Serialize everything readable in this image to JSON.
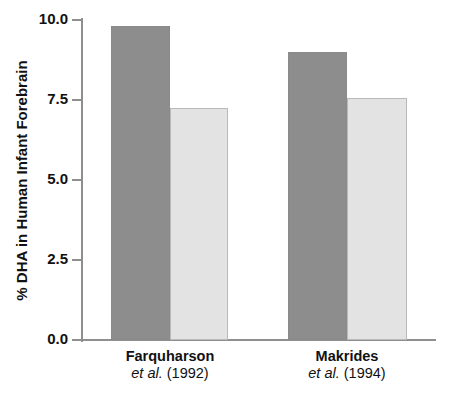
{
  "chart_data": {
    "type": "bar",
    "title": "",
    "xlabel": "",
    "ylabel": "% DHA in Human Infant Forebrain",
    "ylim": [
      0.0,
      10.0
    ],
    "ytick_labels": [
      "0.0",
      "2.5",
      "5.0",
      "7.5",
      "10.0"
    ],
    "ytick_values": [
      0.0,
      2.5,
      5.0,
      7.5,
      10.0
    ],
    "grid": false,
    "legend": "none",
    "categories": [
      "Farquharson et al. (1992)",
      "Makrides et al. (1994)"
    ],
    "category_labels": [
      {
        "name": "Farquharson",
        "cite_italic": "et al.",
        "cite_year": "(1992)"
      },
      {
        "name": "Makrides",
        "cite_italic": "et al.",
        "cite_year": "(1994)"
      }
    ],
    "series": [
      {
        "name": "dark-bar",
        "color": "#8d8d8d",
        "values": [
          9.8,
          9.0
        ]
      },
      {
        "name": "light-bar",
        "color": "#e3e3e3",
        "values": [
          7.25,
          7.55
        ]
      }
    ],
    "bars": [
      {
        "group": "Farquharson et al. (1992)",
        "series": "dark-bar",
        "value": 9.8
      },
      {
        "group": "Farquharson et al. (1992)",
        "series": "light-bar",
        "value": 7.25
      },
      {
        "group": "Makrides et al. (1994)",
        "series": "dark-bar",
        "value": 9.0
      },
      {
        "group": "Makrides et al. (1994)",
        "series": "light-bar",
        "value": 7.55
      }
    ],
    "colors": {
      "dark": "#8d8d8d",
      "light": "#e3e3e3",
      "axis": "#8f8f8f",
      "text": "#111111",
      "background": "#ffffff"
    }
  }
}
